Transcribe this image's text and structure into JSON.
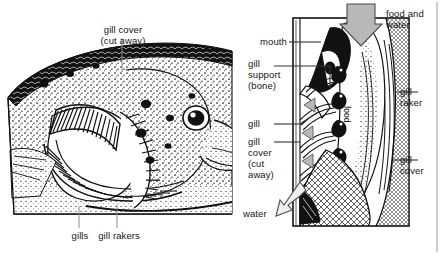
{
  "figure": {
    "kind": "anatomical-diagram",
    "background_color": "#ffffff",
    "ink_color": "#111111",
    "arrow_fill": "#b3b3b3",
    "leader_color": "#8c8c8c",
    "rule_color": "#9a9a9a"
  },
  "left_panel": {
    "name": "fish head cutaway drawing",
    "labels": {
      "gill_cover_cut_away": "gill cover\n(cut away)",
      "gills": "gills",
      "gill_rakers": "gill rakers"
    }
  },
  "right_panel": {
    "name": "gill cross-section schematic",
    "labels": {
      "food_and_water": "food and\nwater",
      "mouth": "mouth",
      "gill_support_bone": "gill\nsupport\n(bone)",
      "gill": "gill",
      "gill_cover_cut_away": "gill\ncover\n(cut\naway)",
      "water": "water",
      "food": "food",
      "gill_raker": "gill\nraker",
      "gill_cover": "gill\ncover"
    }
  }
}
